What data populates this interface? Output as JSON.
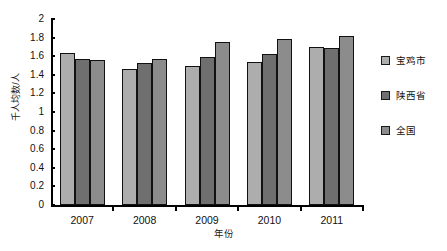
{
  "chart_data": {
    "type": "bar",
    "title": "",
    "xlabel": "年份",
    "ylabel": "千人均数/人",
    "categories": [
      "2007",
      "2008",
      "2009",
      "2010",
      "2011"
    ],
    "series": [
      {
        "name": "宝鸡市",
        "color": "#adadad",
        "values": [
          1.63,
          1.46,
          1.49,
          1.54,
          1.7
        ]
      },
      {
        "name": "陕西省",
        "color": "#6f6f6f",
        "values": [
          1.57,
          1.53,
          1.59,
          1.62,
          1.69
        ]
      },
      {
        "name": "全国",
        "color": "#8c8c8c",
        "values": [
          1.56,
          1.57,
          1.75,
          1.79,
          1.82
        ]
      }
    ],
    "ylim": [
      0,
      2
    ],
    "ytick_step": 0.2,
    "yticks": [
      "2",
      "1.8",
      "1.6",
      "1.4",
      "1.2",
      "1",
      "0.8",
      "0.6",
      "0.4",
      "0.2",
      "0"
    ],
    "grid": false,
    "legend_position": "right"
  }
}
